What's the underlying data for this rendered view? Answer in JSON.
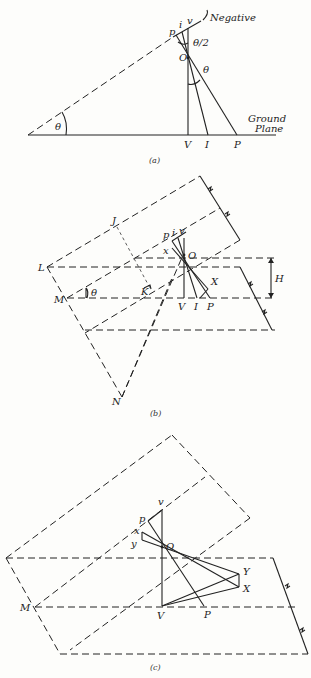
{
  "figure": {
    "panel_a": {
      "caption": "(a)",
      "labels": {
        "negative": "Negative",
        "ground1": "Ground",
        "ground2": "Plane",
        "p": "p",
        "i": "i",
        "v": "v",
        "o": "O",
        "theta_half": "θ/2",
        "theta": "θ",
        "theta_base": "θ",
        "V": "V",
        "I": "I",
        "P": "P"
      }
    },
    "panel_b": {
      "caption": "(b)",
      "labels": {
        "J": "J",
        "L": "L",
        "M": "M",
        "N": "N",
        "K": "K",
        "p": "p",
        "i": "i",
        "v": "v",
        "x": "x",
        "o": "O",
        "X": "X",
        "H": "H",
        "theta": "θ",
        "V": "V",
        "I": "I",
        "P": "P"
      }
    },
    "panel_c": {
      "caption": "(c)",
      "labels": {
        "v": "v",
        "p": "p",
        "x": "x",
        "y": "y",
        "o": "O",
        "Y": "Y",
        "X": "X",
        "M": "M",
        "V": "V",
        "P": "P"
      }
    }
  }
}
